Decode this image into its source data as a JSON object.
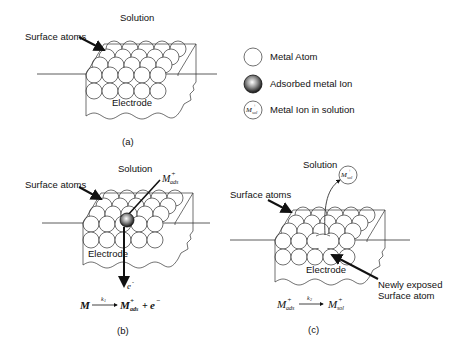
{
  "panels": {
    "a": {
      "caption": "(a)",
      "solution_label": "Solution",
      "surface_label": "Surface atoms",
      "electrode_label": "Electrode"
    },
    "b": {
      "caption": "(b)",
      "solution_label": "Solution",
      "surface_label": "Surface atoms",
      "electrode_label": "Electrode",
      "ion_label": {
        "base": "M",
        "sup": "+",
        "sub": "ads"
      },
      "electron_label": {
        "base": "e",
        "sup": "-"
      },
      "equation": {
        "lhs": "M",
        "rate": "k",
        "rate_sub": "1",
        "rhs_base": "M",
        "rhs_sup": "+",
        "rhs_sub": "ads",
        "plus": "+",
        "electron": "e",
        "electron_sup": "−"
      }
    },
    "c": {
      "caption": "(c)",
      "solution_label": "Solution",
      "surface_label": "Surface atoms",
      "electrode_label": "Electrode",
      "ion_label": {
        "base": "M",
        "sup": "+",
        "sub": "sol"
      },
      "newly_exposed_line1": "Newly exposed",
      "newly_exposed_line2": "Surface atom",
      "equation": {
        "lhs_base": "M",
        "lhs_sup": "+",
        "lhs_sub": "ads",
        "rate": "k",
        "rate_sub": "2",
        "rhs_base": "M",
        "rhs_sup": "+",
        "rhs_sub": "sol"
      }
    }
  },
  "legend": {
    "items": [
      {
        "icon": "metal-atom-icon",
        "label": "Metal Atom"
      },
      {
        "icon": "adsorbed-ion-icon",
        "label": "Adsorbed metal Ion"
      },
      {
        "icon": "solution-ion-icon",
        "label": "Metal Ion in solution",
        "symbol": {
          "base": "M",
          "sup": "+",
          "sub": "sol"
        }
      }
    ]
  },
  "colors": {
    "stroke": "#333333",
    "text": "#111111",
    "background": "#ffffff"
  }
}
